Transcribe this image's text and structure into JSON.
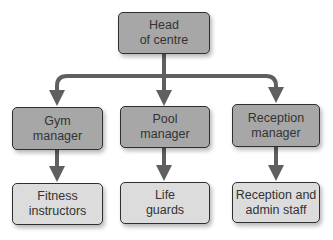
{
  "diagram": {
    "type": "organisation-chart",
    "colors": {
      "top_and_manager_fill": "#a7a7a7",
      "staff_fill": "#dcdcdc",
      "border": "#2f2f2f",
      "arrow": "#5f5f5f"
    },
    "head": {
      "line1": "Head",
      "line2": "of centre"
    },
    "managers": [
      {
        "line1": "Gym",
        "line2": "manager"
      },
      {
        "line1": "Pool",
        "line2": "manager"
      },
      {
        "line1": "Reception",
        "line2": "manager"
      }
    ],
    "staff": [
      {
        "line1": "Fitness",
        "line2": "instructors"
      },
      {
        "line1": "Life",
        "line2": "guards"
      },
      {
        "line1": "Reception and",
        "line2": "admin staff"
      }
    ]
  }
}
